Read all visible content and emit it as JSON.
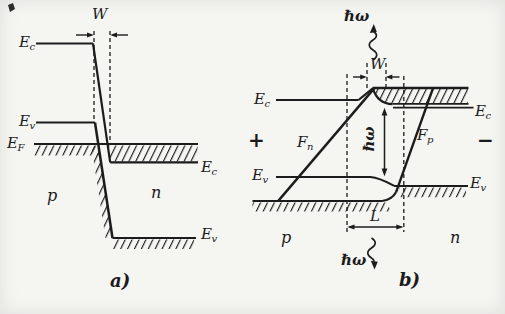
{
  "figure": {
    "paper_color": "#f5f5f2",
    "ink_color": "#1c1c1c",
    "panel_a": {
      "caption": "a)",
      "p_region": "p",
      "n_region": "n",
      "depletion_width_label": "W",
      "band_labels": {
        "ec_left": {
          "base": "E",
          "sub": "c"
        },
        "ev_left": {
          "base": "E",
          "sub": "v"
        },
        "ef": {
          "base": "E",
          "sub": "F"
        },
        "ec_right": {
          "base": "E",
          "sub": "c"
        },
        "ev_right": {
          "base": "E",
          "sub": "v"
        }
      }
    },
    "panel_b": {
      "caption": "b)",
      "p_region": "p",
      "n_region": "n",
      "depletion_width_label": "W",
      "active_length_label": "L",
      "photon_top": "ℏω",
      "photon_mid": "ℏω",
      "photon_bottom": "ℏω",
      "bias_plus": "+",
      "bias_minus": "−",
      "band_labels": {
        "ec_left": {
          "base": "E",
          "sub": "c"
        },
        "ec_right": {
          "base": "E",
          "sub": "c"
        },
        "ev_left": {
          "base": "E",
          "sub": "v"
        },
        "ev_right": {
          "base": "E",
          "sub": "v"
        },
        "fn": {
          "base": "F",
          "sub": "n"
        },
        "fp": {
          "base": "F",
          "sub": "p"
        }
      }
    }
  }
}
